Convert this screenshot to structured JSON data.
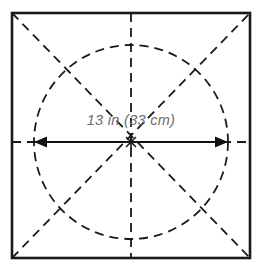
{
  "figure": {
    "name": "square-with-inscribed-circle-diameter-diagram",
    "background_color": "#ffffff",
    "canvas": {
      "width": 263,
      "height": 274
    }
  },
  "square": {
    "name": "outer-square-frame",
    "stroke_color": "#1a1a1a",
    "stroke_width": 2.6,
    "left": 12,
    "top": 13,
    "right": 250,
    "bottom": 258
  },
  "circle": {
    "name": "inscribed-circle",
    "stroke_color": "#1a1a1a",
    "stroke_width": 1.8,
    "dash": "9 6",
    "center_x": 131,
    "center_y": 142,
    "radius": 97
  },
  "axes": {
    "stroke_color": "#1a1a1a",
    "stroke_width": 1.8,
    "dash": "9 6",
    "horizontal": {
      "name": "horizontal-center-line",
      "y": 142,
      "x1": 12,
      "x2": 250
    },
    "vertical": {
      "name": "vertical-center-line",
      "x": 131,
      "y1": 13,
      "y2": 258
    },
    "diagonal_tl_br": {
      "name": "diagonal-top-left-bottom-right",
      "x1": 12,
      "y1": 13,
      "x2": 250,
      "y2": 258
    },
    "diagonal_bl_tr": {
      "name": "diagonal-bottom-left-top-right",
      "x1": 12,
      "y1": 258,
      "x2": 250,
      "y2": 13
    }
  },
  "dimension": {
    "name": "diameter-dimension",
    "label": "13 in (33 cm)",
    "label_color": "#6e6e6e",
    "label_x": 131,
    "label_y": 125,
    "arrow_color": "#111111",
    "arrow_stroke_width": 2.1,
    "arrow_y": 142,
    "arrow_x1": 34,
    "arrow_x2": 228,
    "arrowhead_length": 13,
    "arrowhead_half_width": 5.5
  },
  "center_mark": {
    "name": "center-point-mark",
    "x": 131,
    "y": 142
  }
}
